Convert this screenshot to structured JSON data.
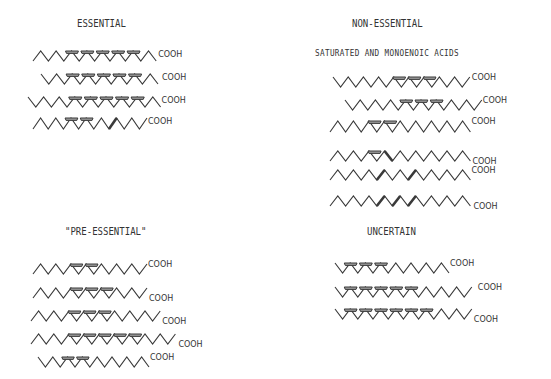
{
  "sections": {
    "essential": {
      "title": "ESSENTIAL"
    },
    "non_essential": {
      "title": "NON-ESSENTIAL",
      "subtitle": "SATURATED AND MONOENOIC ACIDS"
    },
    "pre_essential": {
      "title": "\"PRE-ESSENTIAL\""
    },
    "uncertain": {
      "title": "UNCERTAIN"
    }
  },
  "cooh_label": "COOH",
  "colors": {
    "line": "#3a3a3a",
    "double_bond_fill": "#9a9a9a"
  },
  "chains": [
    {
      "group": "essential",
      "x": 33,
      "y": 51,
      "start": "low",
      "segs": 16,
      "w": 7.7,
      "h": 10,
      "double": [
        4,
        6,
        8,
        10,
        12
      ],
      "cooh_dx": 2,
      "cooh_dy": 3
    },
    {
      "group": "essential",
      "x": 41,
      "y": 74,
      "start": "high",
      "segs": 15,
      "w": 7.8,
      "h": 10,
      "double": [
        3,
        5,
        7,
        9,
        11
      ],
      "cooh_dx": 4,
      "cooh_dy": 3
    },
    {
      "group": "essential",
      "x": 28,
      "y": 97,
      "start": "high",
      "segs": 17,
      "w": 7.8,
      "h": 10,
      "double": [
        5,
        7,
        9,
        11,
        13
      ],
      "cooh_dx": 1,
      "cooh_dy": 3
    },
    {
      "group": "essential",
      "x": 33,
      "y": 118,
      "start": "low",
      "segs": 15,
      "w": 7.6,
      "h": 11,
      "double": [
        4,
        6
      ],
      "cis_thick": [
        10
      ],
      "cooh_dx": 1,
      "cooh_dy": 3
    },
    {
      "group": "non_essential",
      "x": 333,
      "y": 77,
      "start": "high",
      "segs": 18,
      "w": 7.6,
      "h": 10,
      "double": [
        8,
        10,
        12
      ],
      "cooh_dx": 2,
      "cooh_dy": 0
    },
    {
      "group": "non_essential",
      "x": 345,
      "y": 100,
      "start": "high",
      "segs": 18,
      "w": 7.6,
      "h": 10,
      "double": [
        7,
        9,
        11
      ],
      "cooh_dx": 1,
      "cooh_dy": 0
    },
    {
      "group": "non_essential",
      "x": 330,
      "y": 121,
      "start": "low",
      "segs": 18,
      "w": 7.8,
      "h": 11,
      "double": [
        5,
        7
      ],
      "cooh_dx": 1,
      "cooh_dy": 0
    },
    {
      "group": "non_essential",
      "x": 330,
      "y": 151,
      "start": "low",
      "segs": 18,
      "w": 7.8,
      "h": 10,
      "double": [
        5
      ],
      "cis_thick": [
        7
      ],
      "cooh_dx": 2,
      "cooh_dy": 10
    },
    {
      "group": "non_essential",
      "x": 330,
      "y": 170,
      "start": "low",
      "segs": 18,
      "w": 7.8,
      "h": 10,
      "cis_thick": [
        6,
        10
      ],
      "cooh_dx": 1,
      "cooh_dy": 0
    },
    {
      "group": "non_essential",
      "x": 330,
      "y": 196,
      "start": "low",
      "segs": 18,
      "w": 7.8,
      "h": 10,
      "cis_thick": [
        6,
        8,
        10
      ],
      "cooh_dx": 3,
      "cooh_dy": 10
    },
    {
      "group": "pre_essential",
      "x": 33,
      "y": 264,
      "start": "low",
      "segs": 15,
      "w": 7.6,
      "h": 10,
      "double": [
        5,
        7
      ],
      "cooh_dx": 1,
      "cooh_dy": 0
    },
    {
      "group": "pre_essential",
      "x": 33,
      "y": 288,
      "start": "low",
      "segs": 15,
      "w": 7.6,
      "h": 10,
      "double": [
        5,
        7,
        9
      ],
      "cooh_dx": 2,
      "cooh_dy": 10
    },
    {
      "group": "pre_essential",
      "x": 31,
      "y": 311,
      "start": "low",
      "segs": 17,
      "w": 7.6,
      "h": 10,
      "double": [
        5,
        7,
        9
      ],
      "cooh_dx": 2,
      "cooh_dy": 10
    },
    {
      "group": "pre_essential",
      "x": 31,
      "y": 334,
      "start": "low",
      "segs": 19,
      "w": 7.6,
      "h": 10,
      "double": [
        5,
        7,
        9,
        11,
        13
      ],
      "cooh_dx": 3,
      "cooh_dy": 10
    },
    {
      "group": "pre_essential",
      "x": 38,
      "y": 357,
      "start": "high",
      "segs": 15,
      "w": 7.4,
      "h": 10,
      "double": [
        3,
        5
      ],
      "cooh_dx": 1,
      "cooh_dy": 0
    },
    {
      "group": "uncertain",
      "x": 335,
      "y": 263,
      "start": "high",
      "segs": 15,
      "w": 7.6,
      "h": 10,
      "double": [
        1,
        3,
        5
      ],
      "cooh_dx": 1,
      "cooh_dy": 0
    },
    {
      "group": "uncertain",
      "x": 335,
      "y": 287,
      "start": "high",
      "segs": 18,
      "w": 7.6,
      "h": 10,
      "double": [
        1,
        3,
        5,
        7,
        9
      ],
      "cooh_dx": 6,
      "cooh_dy": 0
    },
    {
      "group": "uncertain",
      "x": 335,
      "y": 309,
      "start": "high",
      "segs": 18,
      "w": 7.6,
      "h": 10,
      "double": [
        1,
        3,
        5,
        7,
        9,
        11
      ],
      "cooh_dx": 2,
      "cooh_dy": 10
    }
  ]
}
